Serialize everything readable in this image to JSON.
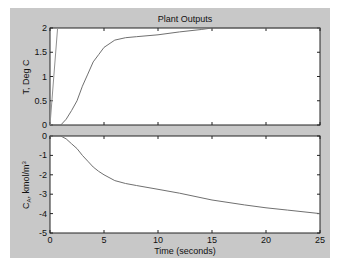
{
  "chart_data": [
    {
      "type": "line",
      "title": "Plant Outputs",
      "xlabel": "",
      "ylabel": "T, Deg C",
      "xlim": [
        0,
        25
      ],
      "ylim": [
        0,
        2
      ],
      "x_ticks": [
        0,
        5,
        10,
        15,
        20,
        25
      ],
      "y_ticks": [
        "0",
        "0.5",
        "1",
        "1.5",
        "2"
      ],
      "grid": false,
      "series": [
        {
          "name": "T",
          "x": [
            0,
            1,
            1.5,
            2,
            2.5,
            3,
            3.5,
            4,
            4.5,
            5,
            6,
            7,
            8,
            10,
            12,
            14,
            15,
            20,
            25
          ],
          "values": [
            0,
            0,
            0.12,
            0.3,
            0.5,
            0.8,
            1.05,
            1.3,
            1.45,
            1.6,
            1.75,
            1.8,
            1.82,
            1.86,
            1.92,
            1.97,
            2.0,
            2.0,
            2.0
          ]
        },
        {
          "name": "steep-line",
          "x": [
            0,
            0.7
          ],
          "values": [
            0,
            2
          ]
        }
      ]
    },
    {
      "type": "line",
      "title": "",
      "xlabel": "Time (seconds)",
      "ylabel": "C_A, kmol/m^3",
      "xlim": [
        0,
        25
      ],
      "ylim": [
        -5,
        0
      ],
      "x_ticks": [
        "0",
        "5",
        "10",
        "15",
        "20",
        "25"
      ],
      "y_ticks": [
        "0",
        "-1",
        "-2",
        "-3",
        "-4",
        "-5"
      ],
      "grid": false,
      "series": [
        {
          "name": "CA",
          "x": [
            0,
            1,
            1.5,
            2,
            2.5,
            3,
            3.5,
            4,
            4.5,
            5,
            6,
            7,
            8,
            10,
            12,
            15,
            18,
            20,
            22,
            25
          ],
          "values": [
            0,
            0,
            -0.15,
            -0.4,
            -0.65,
            -1.0,
            -1.3,
            -1.6,
            -1.82,
            -2.0,
            -2.3,
            -2.45,
            -2.55,
            -2.75,
            -2.95,
            -3.3,
            -3.55,
            -3.7,
            -3.82,
            -4.0
          ]
        }
      ]
    }
  ],
  "figure": {
    "title": "Plant Outputs",
    "top_ylabel": "T, Deg C",
    "bottom_ylabel_main": "C",
    "bottom_ylabel_sub": "A",
    "bottom_ylabel_rest": ", kmol/m",
    "bottom_ylabel_sup": "3",
    "xlabel": "Time (seconds)",
    "x_tick_labels": [
      "0",
      "5",
      "10",
      "15",
      "20",
      "25"
    ],
    "top_y_tick_labels": [
      "2",
      "1.5",
      "1",
      "0.5",
      "0"
    ],
    "bottom_y_tick_labels": [
      "0",
      "-1",
      "-2",
      "-3",
      "-4",
      "-5"
    ],
    "colors": {
      "figure_bg": "#c8c8c8",
      "axes_bg": "#ffffff",
      "line": "#707070",
      "axis": "#222222"
    }
  }
}
